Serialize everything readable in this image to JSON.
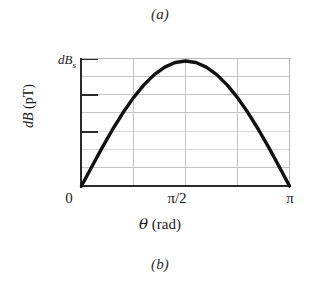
{
  "figure": {
    "caption_top": "(a)",
    "caption_bottom": "(b)",
    "background_color": "#ffffff",
    "curve_color": "#111111",
    "grid_color": "#c4c4c4",
    "axis_color": "#2a2a2a"
  },
  "axes": {
    "y_max_label": "dB",
    "y_max_label_sub": "s",
    "y_title_italic": "dB",
    "y_title_unit": " (pT)",
    "x_title_symbol": "θ",
    "x_title_unit": " (rad)",
    "x_ticks": [
      {
        "label": "0"
      },
      {
        "label": "π/2"
      },
      {
        "label": "π"
      }
    ]
  },
  "chart_data": {
    "type": "line",
    "title": "",
    "subtitle": "",
    "xlabel": "θ (rad)",
    "ylabel": "dB (pT)",
    "xlim": [
      0,
      3.14159
    ],
    "ylim": [
      0,
      1
    ],
    "xtick_labels": [
      "0",
      "π/2",
      "π"
    ],
    "xtick_values": [
      0,
      1.5708,
      3.14159
    ],
    "ytick_labels": [
      "",
      "",
      "dB_s"
    ],
    "ytick_values": [
      0.2857,
      0.5714,
      1.0
    ],
    "grid": true,
    "grid_horizontal_count": 6,
    "grid_vertical_count": 3,
    "legend": "none",
    "series": [
      {
        "name": "dB(θ) = dB_s sin(θ)",
        "x": [
          0.0,
          0.1571,
          0.3142,
          0.4712,
          0.6283,
          0.7854,
          0.9425,
          1.0996,
          1.2566,
          1.4137,
          1.5708,
          1.7279,
          1.885,
          2.042,
          2.1991,
          2.3562,
          2.5133,
          2.6704,
          2.8274,
          2.9845,
          3.14159
        ],
        "y": [
          0.0,
          0.1564,
          0.309,
          0.454,
          0.5878,
          0.7071,
          0.809,
          0.891,
          0.9511,
          0.9877,
          1.0,
          0.9877,
          0.9511,
          0.891,
          0.809,
          0.7071,
          0.5878,
          0.454,
          0.309,
          0.1564,
          0.0
        ]
      }
    ]
  }
}
